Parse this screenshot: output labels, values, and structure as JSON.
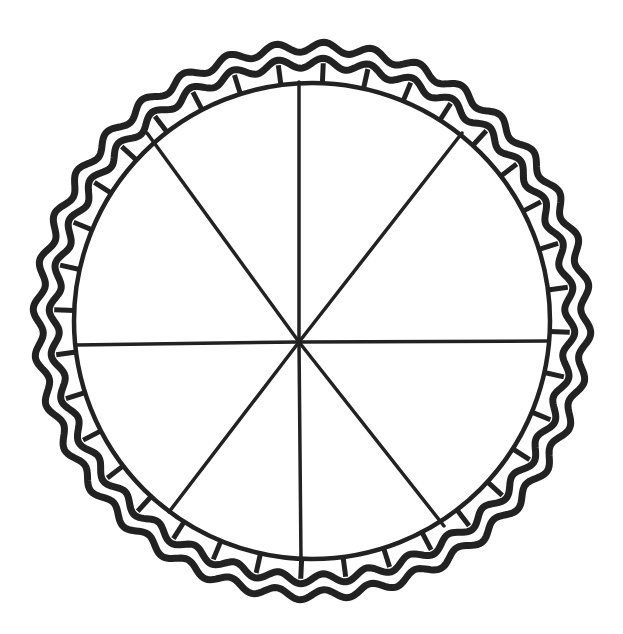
{
  "illustration": {
    "subject": "pie-divided-into-eight-slices",
    "background": "#ffffff",
    "ink": "#222222",
    "slices": 8,
    "center_hub": {
      "x": 299,
      "y": 342
    },
    "inner_circle": {
      "cx": 312,
      "cy": 321,
      "r": 238
    },
    "crust": {
      "inner_r": 238,
      "outer_r": 278,
      "wave_count": 36
    },
    "spokes": [
      {
        "x": 299,
        "y": 82
      },
      {
        "x": 462,
        "y": 133
      },
      {
        "x": 548,
        "y": 341
      },
      {
        "x": 444,
        "y": 526
      },
      {
        "x": 301,
        "y": 560
      },
      {
        "x": 169,
        "y": 512
      },
      {
        "x": 76,
        "y": 345
      },
      {
        "x": 147,
        "y": 133
      }
    ]
  }
}
